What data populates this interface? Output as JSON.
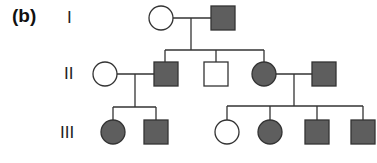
{
  "panel_label": "(b)",
  "generations": [
    {
      "label": "I",
      "y": 18
    },
    {
      "label": "II",
      "y": 74
    },
    {
      "label": "III",
      "y": 133
    }
  ],
  "colors": {
    "affected": "#5e5e5e",
    "unaffected": "#ffffff",
    "line": "#333333"
  },
  "individuals": [
    {
      "id": "I-1",
      "sex": "female",
      "affected": false
    },
    {
      "id": "I-2",
      "sex": "male",
      "affected": true
    },
    {
      "id": "II-1",
      "sex": "female",
      "affected": false
    },
    {
      "id": "II-2",
      "sex": "male",
      "affected": true
    },
    {
      "id": "II-3",
      "sex": "male",
      "affected": false
    },
    {
      "id": "II-4",
      "sex": "female",
      "affected": true
    },
    {
      "id": "II-5",
      "sex": "male",
      "affected": true
    },
    {
      "id": "III-1",
      "sex": "female",
      "affected": true
    },
    {
      "id": "III-2",
      "sex": "male",
      "affected": true
    },
    {
      "id": "III-3",
      "sex": "female",
      "affected": false
    },
    {
      "id": "III-4",
      "sex": "female",
      "affected": true
    },
    {
      "id": "III-5",
      "sex": "male",
      "affected": true
    },
    {
      "id": "III-6",
      "sex": "male",
      "affected": true
    }
  ]
}
